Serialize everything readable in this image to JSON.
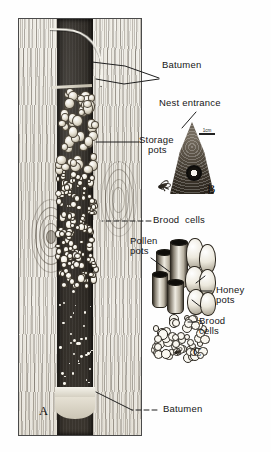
{
  "figure": {
    "type": "scientific-illustration",
    "background_color": "#ffffff",
    "ink_color": "#1a1a1a"
  },
  "panels": [
    {
      "id": "A",
      "letter": "A",
      "caption": "Longitudinal section of nest in tree trunk"
    },
    {
      "id": "B",
      "letter": "B",
      "caption": "Nest entrance tube"
    },
    {
      "id": "C",
      "letter": "C",
      "caption": "Storage pots and brood cell cluster"
    }
  ],
  "labels": {
    "batumen_top": "Batumen",
    "storage_pots_line1": "Storage",
    "storage_pots_line2": "pots",
    "nest_entrance": "Nest entrance",
    "brood_cells_a": "Brood  cells",
    "pollen_pots_line1": "Pollen",
    "pollen_pots_line2": "pots",
    "honey_pots_line1": "Honey",
    "honey_pots_line2": "pots",
    "brood_cells_c_line1": "Brood",
    "brood_cells_c_line2": "cells",
    "batumen_bottom": "Batumen"
  },
  "scale_bars": [
    {
      "id": "scale-panel-a",
      "text": "1cm"
    },
    {
      "id": "scale-panel-b",
      "text": "1cm"
    }
  ]
}
